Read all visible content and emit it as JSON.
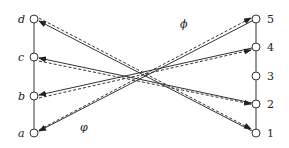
{
  "diagram": {
    "left_nodes": [
      {
        "id": "d",
        "label": "d",
        "y": 19
      },
      {
        "id": "c",
        "label": "c",
        "y": 57
      },
      {
        "id": "b",
        "label": "b",
        "y": 96
      },
      {
        "id": "a",
        "label": "a",
        "y": 133
      }
    ],
    "right_nodes": [
      {
        "id": "5",
        "label": "5",
        "y": 19
      },
      {
        "id": "4",
        "label": "4",
        "y": 47
      },
      {
        "id": "3",
        "label": "3",
        "y": 76
      },
      {
        "id": "2",
        "label": "2",
        "y": 104
      },
      {
        "id": "1",
        "label": "1",
        "y": 133
      }
    ],
    "map_labels": {
      "phi_upper": "ϕ",
      "phi_lower": "φ"
    },
    "solid_edges_right_to_left": [
      [
        "1",
        "d"
      ],
      [
        "2",
        "c"
      ],
      [
        "4",
        "b"
      ],
      [
        "5",
        "a"
      ]
    ],
    "dashed_edges_left_to_right": [
      [
        "d",
        "1"
      ],
      [
        "c",
        "2"
      ],
      [
        "b",
        "4"
      ],
      [
        "a",
        "5"
      ]
    ],
    "colors": {
      "line": "#333333",
      "node_fill": "#ffffff"
    }
  }
}
